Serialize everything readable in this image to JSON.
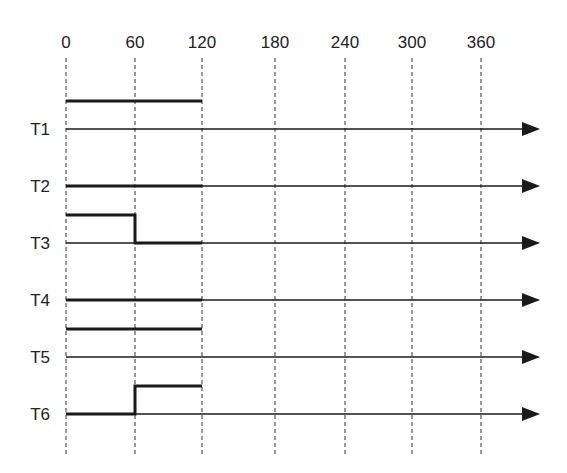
{
  "diagram": {
    "type": "timing-diagram",
    "time_axis": {
      "ticks": [
        "0",
        "60",
        "120",
        "180",
        "240",
        "300",
        "360"
      ],
      "tick_values": [
        0,
        60,
        120,
        180,
        240,
        300,
        360
      ]
    },
    "rows": [
      {
        "label": "T1",
        "signal": [
          {
            "from": 0,
            "to": 120,
            "level": "high"
          }
        ]
      },
      {
        "label": "T2",
        "signal": [
          {
            "from": 0,
            "to": 120,
            "level": "low"
          }
        ]
      },
      {
        "label": "T3",
        "signal": [
          {
            "from": 0,
            "to": 60,
            "level": "high"
          },
          {
            "from": 60,
            "to": 120,
            "level": "low"
          }
        ]
      },
      {
        "label": "T4",
        "signal": [
          {
            "from": 0,
            "to": 120,
            "level": "low"
          }
        ]
      },
      {
        "label": "T5",
        "signal": [
          {
            "from": 0,
            "to": 120,
            "level": "high"
          }
        ]
      },
      {
        "label": "T6",
        "signal": [
          {
            "from": 0,
            "to": 60,
            "level": "low"
          },
          {
            "from": 60,
            "to": 120,
            "level": "high"
          }
        ]
      }
    ],
    "colors": {
      "line": "#1a1a1a",
      "grid": "#333333",
      "background": "#ffffff"
    }
  }
}
